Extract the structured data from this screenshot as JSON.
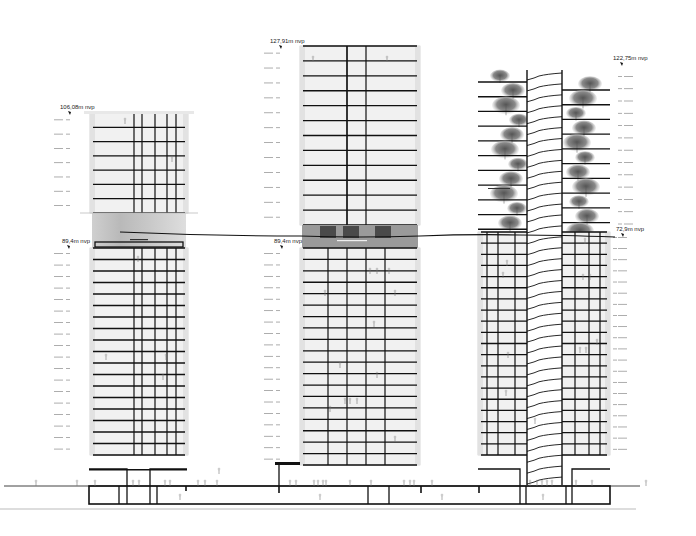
{
  "drawing": {
    "type": "architectural-section",
    "background": "#ffffff",
    "line_color": "#111111",
    "facade_color": "#e6e6e6"
  },
  "towers": [
    {
      "id": "left",
      "x": 90,
      "width": 98,
      "upper": {
        "top": 113,
        "bottom": 213,
        "floors": 7
      },
      "amenity": {
        "top": 213,
        "bottom": 248,
        "label": "swimming pool"
      },
      "lower": {
        "top": 248,
        "bottom": 455,
        "floors": 18
      },
      "cores": [
        134,
        142,
        155,
        167,
        176
      ],
      "top_elevation": "106,08m nvp",
      "amenity_elevation": "89,4m nvp",
      "top_label_pos": [
        60,
        109
      ],
      "amenity_label_pos": [
        62,
        243
      ]
    },
    {
      "id": "middle",
      "x": 300,
      "width": 120,
      "upper": {
        "top": 46,
        "bottom": 225,
        "floors": 12
      },
      "amenity": {
        "top": 225,
        "bottom": 248,
        "label": "sky restaurant"
      },
      "lower": {
        "top": 248,
        "bottom": 465,
        "floors": 19
      },
      "cores": [
        328,
        347,
        366,
        385
      ],
      "top_elevation": "127,91m nvp",
      "amenity_elevation": "89,4m nvp",
      "top_label_pos": [
        270,
        43
      ],
      "amenity_label_pos": [
        274,
        243
      ]
    },
    {
      "id": "right",
      "x": 478,
      "width": 132,
      "upper_garden": {
        "top": 70,
        "bottom": 232,
        "floors": 11,
        "label": "garden"
      },
      "lower": {
        "top": 232,
        "bottom": 455,
        "floors": 20
      },
      "stair_core": [
        527,
        562
      ],
      "top_elevation": "122,75m nvp",
      "amenity_elevation": "72,9m nvp",
      "top_label_pos": [
        613,
        60
      ],
      "amenity_label_pos": [
        616,
        231
      ]
    }
  ],
  "ground": {
    "ground_line_y": 486,
    "podium_bottom_y": 504,
    "baseline_y": 509
  },
  "labels": {
    "elev_left_top": "106,08m nvp",
    "elev_left_mid": "89,4m nvp",
    "elev_mid_top": "127,91m nvp",
    "elev_mid_mid": "89,4m nvp",
    "elev_right_top": "122,75m nvp",
    "elev_right_mid": "72,9m nvp"
  }
}
